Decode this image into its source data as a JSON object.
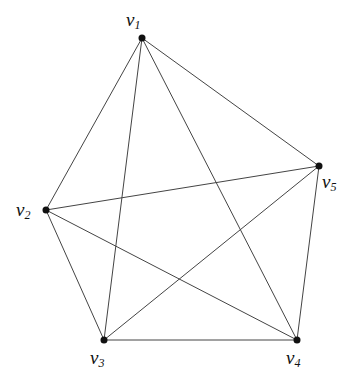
{
  "diagram": {
    "type": "graph",
    "name": "complete graph K5",
    "nodes": [
      {
        "id": "v1",
        "label": "v",
        "sub": "1",
        "x": 142,
        "y": 38,
        "lx": 126,
        "ly": 10
      },
      {
        "id": "v2",
        "label": "v",
        "sub": "2",
        "x": 46,
        "y": 210,
        "lx": 16,
        "ly": 200
      },
      {
        "id": "v3",
        "label": "v",
        "sub": "3",
        "x": 104,
        "y": 340,
        "lx": 90,
        "ly": 348
      },
      {
        "id": "v4",
        "label": "v",
        "sub": "4",
        "x": 297,
        "y": 340,
        "lx": 286,
        "ly": 348
      },
      {
        "id": "v5",
        "label": "v",
        "sub": "5",
        "x": 319,
        "y": 166,
        "lx": 322,
        "ly": 172
      }
    ],
    "edges": [
      [
        "v1",
        "v2"
      ],
      [
        "v1",
        "v3"
      ],
      [
        "v1",
        "v4"
      ],
      [
        "v1",
        "v5"
      ],
      [
        "v2",
        "v3"
      ],
      [
        "v2",
        "v4"
      ],
      [
        "v2",
        "v5"
      ],
      [
        "v3",
        "v4"
      ],
      [
        "v3",
        "v5"
      ],
      [
        "v4",
        "v5"
      ]
    ],
    "edge_color": "#444444",
    "node_color": "#111111"
  }
}
